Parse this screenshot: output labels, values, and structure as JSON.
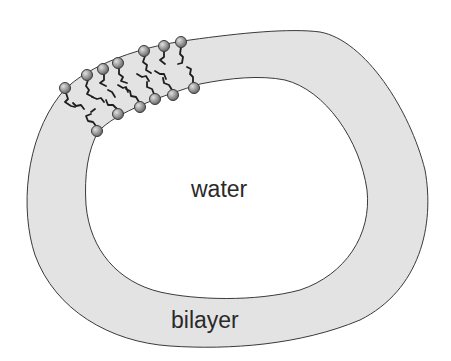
{
  "diagram": {
    "type": "lipid-vesicle-cross-section",
    "labels": {
      "interior": "water",
      "membrane": "bilayer"
    },
    "colors": {
      "background": "#ffffff",
      "bilayer_fill": "#e3e3e3",
      "outline": "#3a3a3a",
      "head_fill": "#9a9a9a",
      "head_highlight": "#d8d8d8",
      "tail": "#1e1e1e",
      "text": "#2a2a2a"
    },
    "lipid_heads": {
      "outer_leaflet": [
        [
          65,
          88
        ],
        [
          87,
          75
        ],
        [
          103,
          69
        ],
        [
          118,
          63
        ],
        [
          144,
          51
        ],
        [
          164,
          46
        ],
        [
          181,
          42
        ]
      ],
      "inner_leaflet": [
        [
          97,
          131
        ],
        [
          118,
          114
        ],
        [
          140,
          107
        ],
        [
          155,
          99
        ],
        [
          173,
          95
        ],
        [
          194,
          88
        ]
      ]
    }
  }
}
